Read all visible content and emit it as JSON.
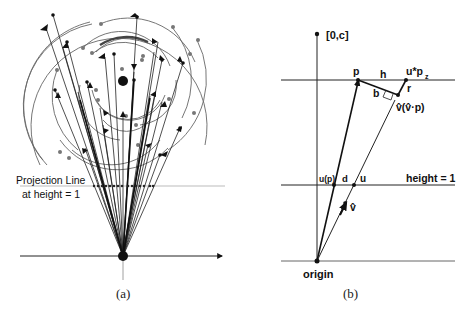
{
  "figure": {
    "panel_a": {
      "caption": "(a)",
      "projection_label_line1": "Projection Line",
      "projection_label_line2": "at height = 1"
    },
    "panel_b": {
      "caption": "(b)",
      "labels": {
        "top_point": "[0,c]",
        "p": "p",
        "h": "h",
        "u_pz": "u*p",
        "u_pz_sub": "z",
        "r": "r",
        "b": "b",
        "vhat_vhat_p": "v̂(v̂·p)",
        "u_of_p": "u(p)",
        "d": "d",
        "u": "u",
        "height_eq_1": "height = 1",
        "vhat": "v̂",
        "origin": "origin"
      }
    },
    "colors": {
      "ink": "#111111",
      "gray_ink": "#666666",
      "light_line": "#999999",
      "background": "#ffffff"
    }
  }
}
